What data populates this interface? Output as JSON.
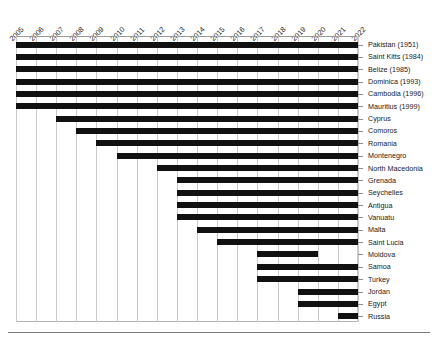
{
  "chart_data": {
    "type": "bar",
    "orientation": "horizontal-gantt",
    "title": "",
    "subtitle": "",
    "xlabel": "",
    "ylabel": "",
    "xlim": [
      2005,
      2022
    ],
    "grid": true,
    "legend": null,
    "x_ticks": [
      "2005",
      "2006",
      "2007",
      "2008",
      "2009",
      "2010",
      "2011",
      "2012",
      "2013",
      "2014",
      "2015",
      "2016",
      "2017",
      "2018",
      "2019",
      "2020",
      "2021",
      "2022"
    ],
    "categories": [
      "Pakistan (1951)",
      "Saint Kitts (1984)",
      "Belize (1985)",
      "Dominica (1993)",
      "Cambodia (1996)",
      "Mauritius (1999)",
      "Cyprus",
      "Comoros",
      "Romania",
      "Montenegro",
      "North Macedonia",
      "Grenada",
      "Seychelles",
      "Antigua",
      "Vanuatu",
      "Malta",
      "Saint Lucia",
      "Moldova",
      "Samoa",
      "Turkey",
      "Jordan",
      "Egypt",
      "Russia"
    ],
    "spans": [
      {
        "label": "Pakistan (1951)",
        "start": 2005,
        "end": 2022
      },
      {
        "label": "Saint Kitts (1984)",
        "start": 2005,
        "end": 2022
      },
      {
        "label": "Belize (1985)",
        "start": 2005,
        "end": 2022
      },
      {
        "label": "Dominica (1993)",
        "start": 2005,
        "end": 2022
      },
      {
        "label": "Cambodia (1996)",
        "start": 2005,
        "end": 2022
      },
      {
        "label": "Mauritius (1999)",
        "start": 2005,
        "end": 2022
      },
      {
        "label": "Cyprus",
        "start": 2007,
        "end": 2022
      },
      {
        "label": "Comoros",
        "start": 2008,
        "end": 2022
      },
      {
        "label": "Romania",
        "start": 2009,
        "end": 2022
      },
      {
        "label": "Montenegro",
        "start": 2010,
        "end": 2022
      },
      {
        "label": "North Macedonia",
        "start": 2012,
        "end": 2022
      },
      {
        "label": "Grenada",
        "start": 2013,
        "end": 2022
      },
      {
        "label": "Seychelles",
        "start": 2013,
        "end": 2022
      },
      {
        "label": "Antigua",
        "start": 2013,
        "end": 2022
      },
      {
        "label": "Vanuatu",
        "start": 2013,
        "end": 2022
      },
      {
        "label": "Malta",
        "start": 2014,
        "end": 2022
      },
      {
        "label": "Saint Lucia",
        "start": 2015,
        "end": 2022
      },
      {
        "label": "Moldova",
        "start": 2017,
        "end": 2020
      },
      {
        "label": "Samoa",
        "start": 2017,
        "end": 2022
      },
      {
        "label": "Turkey",
        "start": 2017,
        "end": 2022
      },
      {
        "label": "Jordan",
        "start": 2019,
        "end": 2022
      },
      {
        "label": "Egypt",
        "start": 2019,
        "end": 2022
      },
      {
        "label": "Russia",
        "start": 2021,
        "end": 2022
      }
    ]
  },
  "colors": {
    "bar": "#111111",
    "grid": "#c9c9c9",
    "axis": "#7a7a7a",
    "text": "#1a1a1a",
    "background": "#ffffff"
  }
}
